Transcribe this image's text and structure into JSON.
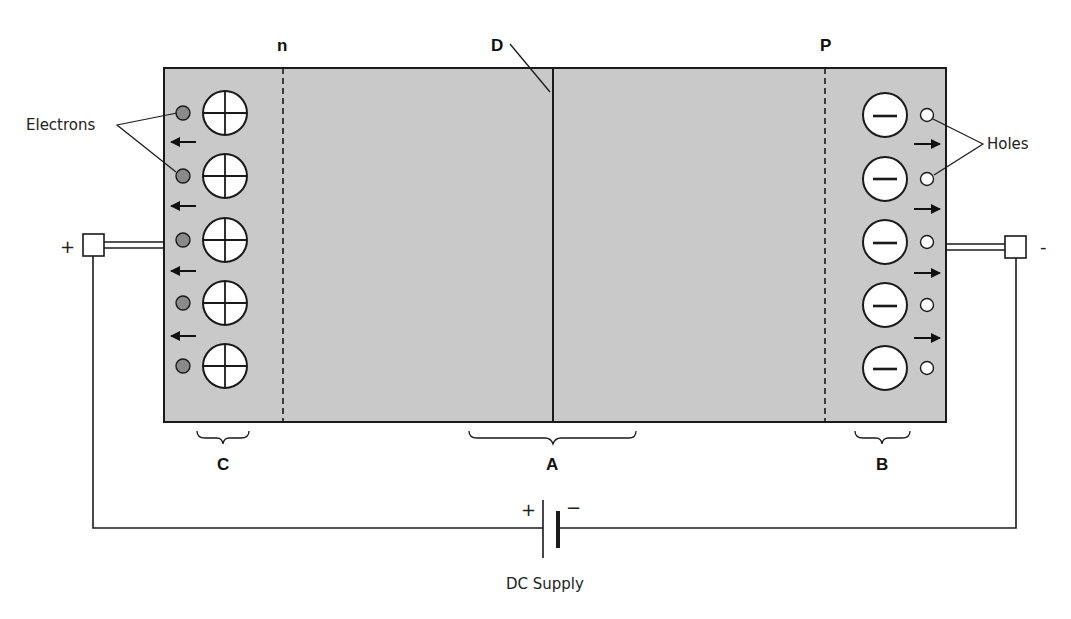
{
  "diagram": {
    "type": "pn-junction-reverse-bias",
    "regions": {
      "n_label": "n",
      "p_label": "P",
      "junction_label": "D"
    },
    "brackets": {
      "left": "C",
      "center": "A",
      "right": "B"
    },
    "callouts": {
      "electrons": "Electrons",
      "holes": "Holes"
    },
    "terminals": {
      "left_sign": "+",
      "right_sign": "-"
    },
    "supply": {
      "label": "DC Supply",
      "plus": "+",
      "minus": "−"
    },
    "left_column": {
      "ion_symbol": "plus-circle",
      "carrier": "electron",
      "count": 5,
      "arrow_direction": "left"
    },
    "right_column": {
      "ion_symbol": "minus-circle",
      "carrier": "hole",
      "count": 5,
      "arrow_direction": "right"
    },
    "colors": {
      "semiconductor_fill": "#c9c9c9",
      "electron_fill": "#8a8a8a",
      "hole_fill": "#ffffff",
      "stroke": "#1a1a1a"
    }
  }
}
